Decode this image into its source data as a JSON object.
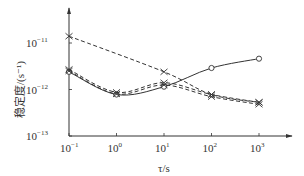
{
  "chart_data": {
    "type": "line",
    "title": "",
    "xlabel": "τ/s",
    "ylabel": "稳定度/(s⁻¹)",
    "xscale": "log",
    "yscale": "log",
    "xlim": [
      0.1,
      1000
    ],
    "ylim": [
      1e-13,
      3e-11
    ],
    "x_ticks": [
      {
        "value": 0.1,
        "base": "10",
        "exp": "−1"
      },
      {
        "value": 1,
        "base": "10",
        "exp": "0"
      },
      {
        "value": 10,
        "base": "10",
        "exp": "1"
      },
      {
        "value": 100,
        "base": "10",
        "exp": "2"
      },
      {
        "value": 1000,
        "base": "10",
        "exp": "3"
      }
    ],
    "y_ticks": [
      {
        "value": 1e-11,
        "base": "10",
        "exp": "−11"
      },
      {
        "value": 1e-12,
        "base": "10",
        "exp": "−12"
      },
      {
        "value": 1e-13,
        "base": "10",
        "exp": "−13"
      }
    ],
    "grid": false,
    "legend": null,
    "x": [
      0.1,
      1,
      10,
      100,
      1000
    ],
    "series": [
      {
        "name": "solid-circle",
        "line": "solid",
        "marker": "circle",
        "values": [
          2.4e-12,
          7.8e-13,
          1.15e-12,
          2.9e-12,
          4.6e-12
        ]
      },
      {
        "name": "dashed-cross-upper",
        "line": "dashed",
        "marker": "x",
        "values": [
          1.4e-11,
          null,
          2.4e-12,
          7.8e-13,
          5.3e-13
        ]
      },
      {
        "name": "dashed-cross-middle",
        "line": "dashed",
        "marker": "x",
        "values": [
          2.7e-12,
          8.7e-13,
          1.4e-12,
          7.8e-13,
          5.3e-13
        ]
      },
      {
        "name": "dashed-cross-lower",
        "line": "dashed",
        "marker": "x",
        "values": [
          2.5e-12,
          8e-13,
          1.25e-12,
          7e-13,
          4.8e-13
        ]
      }
    ]
  },
  "colors": {
    "line": "#333333",
    "background": "#ffffff"
  }
}
